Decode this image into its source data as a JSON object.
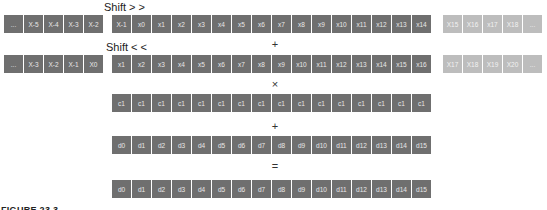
{
  "labels": {
    "shift_right": "Shift > >",
    "shift_left": "Shift < <",
    "op_plus_1": "+",
    "op_times": "×",
    "op_plus_2": "+",
    "op_equals": "=",
    "caption": "FIGURE 23.3"
  },
  "rows": {
    "shift_right": {
      "left": [
        "...",
        "X-5",
        "X-4",
        "X-3",
        "X-2"
      ],
      "main": [
        "X-1",
        "x0",
        "x1",
        "x2",
        "x3",
        "x4",
        "x5",
        "x6",
        "x7",
        "x8",
        "x9",
        "x10",
        "x11",
        "x12",
        "x13",
        "x14"
      ],
      "right": [
        "X15",
        "X16",
        "x17",
        "X18",
        "..."
      ]
    },
    "shift_left": {
      "left": [
        "...",
        "X-3",
        "X-2",
        "X-1",
        "X0"
      ],
      "main": [
        "x1",
        "x2",
        "x3",
        "x4",
        "x5",
        "x6",
        "x7",
        "x8",
        "x9",
        "x10",
        "x11",
        "x12",
        "x13",
        "x14",
        "x15",
        "x16"
      ],
      "right": [
        "X17",
        "X18",
        "X19",
        "X20",
        "..."
      ]
    },
    "coeff": [
      "c1",
      "c1",
      "c1",
      "c1",
      "c1",
      "c1",
      "c1",
      "c1",
      "c1",
      "c1",
      "c1",
      "c1",
      "c1",
      "c1",
      "c1",
      "c1"
    ],
    "d_in": [
      "d0",
      "d1",
      "d2",
      "d3",
      "d4",
      "d5",
      "d6",
      "d7",
      "d8",
      "d9",
      "d10",
      "d11",
      "d12",
      "d13",
      "d14",
      "d15"
    ],
    "d_out": [
      "d0",
      "d1",
      "d2",
      "d3",
      "d4",
      "d5",
      "d6",
      "d7",
      "d8",
      "d9",
      "d10",
      "d11",
      "d12",
      "d13",
      "d14",
      "d15"
    ]
  },
  "colors": {
    "cell_dark": "#767676",
    "cell_light": "#bdbdbd",
    "cell_text": "#e8e8e8"
  }
}
